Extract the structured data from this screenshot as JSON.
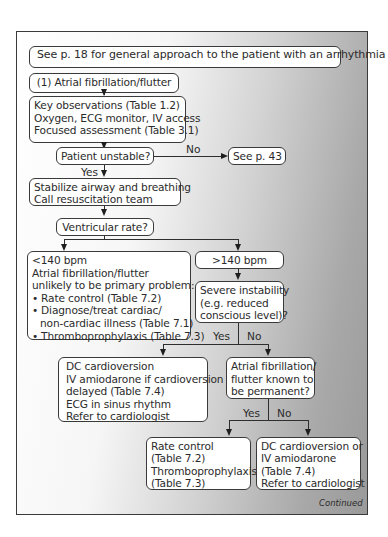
{
  "flowchart": {
    "header": "See p. 18 for general approach to the patient with an arrhythmia",
    "start": "(1) Atrial fibrillation/flutter",
    "key_observations": [
      "Key observations (Table 1.2)",
      "Oxygen, ECG monitor, IV access",
      "Focused assessment (Table 3.1)"
    ],
    "patient_unstable": "Patient unstable?",
    "no_label_1": "No",
    "see_p43": "See p. 43",
    "yes_label_1": "Yes",
    "stabilize": [
      "Stabilize airway and breathing",
      "Call resuscitation team"
    ],
    "ventricular_rate": "Ventricular rate?",
    "low_rate": {
      "lines": [
        "<140 bpm",
        "Atrial fibrillation/flutter",
        "unlikely to be primary problem:"
      ],
      "bullets": [
        "Rate control (Table 7.2)",
        "Diagnose/treat cardiac/",
        "Thromboprophylaxis (Table 7.3)"
      ],
      "bullet_continuation": "non-cardiac illness (Table 7.1)"
    },
    "high_rate": ">140 bpm",
    "severe_instability": [
      "Severe instability",
      "(e.g. reduced",
      "conscious level)?"
    ],
    "yes_label_2": "Yes",
    "no_label_2": "No",
    "dc_cardioversion": [
      "DC cardioversion",
      "IV amiodarone if cardioversion",
      "delayed (Table 7.4)",
      "ECG in sinus rhythm",
      "Refer to cardiologist"
    ],
    "permanent_question": [
      "Atrial fibrillation/",
      "flutter known to",
      "be permanent?"
    ],
    "yes_label_3": "Yes",
    "no_label_3": "No",
    "rate_control": [
      "Rate control",
      "(Table 7.2)",
      "Thromboprophylaxis",
      "(Table 7.3)"
    ],
    "dc_or_amiodarone": [
      "DC cardioversion or",
      "IV amiodarone",
      "(Table 7.4)",
      "Refer to cardiologist"
    ],
    "continued": "Continued"
  },
  "colors": {
    "border": "#3a3a3a",
    "box_fill": "#ffffff",
    "gradient_light": "#ffffff",
    "gradient_dark": "#9a9a9a",
    "text": "#2b2b2b"
  }
}
